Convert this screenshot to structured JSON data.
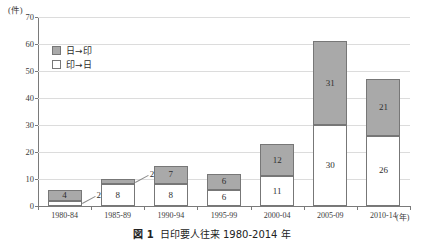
{
  "caption": {
    "number": "図 1",
    "text": "日印要人往来 1980-2014 年"
  },
  "legend": {
    "position": "upper-left-inside",
    "items": [
      {
        "label": "日→印",
        "swatch": "filled",
        "color": "#a9a9a9"
      },
      {
        "label": "印→日",
        "swatch": "hollow",
        "color": "#ffffff"
      }
    ]
  },
  "axes": {
    "y_unit": "(件)",
    "x_unit": "(年)",
    "yticks": [
      "0",
      "10",
      "20",
      "30",
      "40",
      "50",
      "60",
      "70"
    ]
  },
  "chart_data": {
    "type": "bar",
    "subtype": "stacked-vertical",
    "xlabel": "(年)",
    "ylabel": "(件)",
    "ylim": [
      0,
      70
    ],
    "ytick_step": 10,
    "grid": true,
    "legend_position": "upper left (inside plot)",
    "categories": [
      "1980-84",
      "1985-89",
      "1990-94",
      "1995-99",
      "2000-04",
      "2005-09",
      "2010-14"
    ],
    "series": [
      {
        "name": "印→日",
        "stack_position": "bottom",
        "color": "#ffffff",
        "values": [
          2,
          8,
          8,
          6,
          11,
          30,
          26
        ],
        "label_placement": [
          "callout",
          "inside",
          "inside",
          "inside",
          "inside",
          "inside",
          "inside"
        ]
      },
      {
        "name": "日→印",
        "stack_position": "top",
        "color": "#a9a9a9",
        "values": [
          4,
          2,
          7,
          6,
          12,
          31,
          21
        ],
        "label_placement": [
          "inside",
          "callout",
          "inside",
          "inside",
          "inside",
          "inside",
          "inside"
        ]
      }
    ],
    "totals": [
      6,
      10,
      15,
      12,
      23,
      61,
      47
    ]
  }
}
